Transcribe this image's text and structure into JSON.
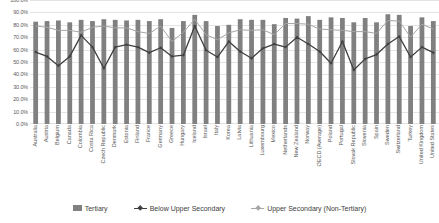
{
  "chart_data": {
    "type": "bar",
    "title": "",
    "subtitle": "",
    "xlabel": "",
    "ylabel": "",
    "ylim": [
      0,
      1.0
    ],
    "grid": true,
    "legend_position": "bottom",
    "y_tick_labels": [
      "100.0%",
      "90.0%",
      "80.0%",
      "70.0%",
      "60.0%",
      "50.0%",
      "40.0%",
      "30.0%",
      "20.0%",
      "10.0%",
      "0.0%"
    ],
    "y_tick_values": [
      1.0,
      0.9,
      0.8,
      0.7,
      0.6,
      0.5,
      0.4,
      0.3,
      0.2,
      0.1,
      0.0
    ],
    "categories": [
      "Australia",
      "Austria",
      "Belgium",
      "Canada",
      "Colombia",
      "Costa Rica",
      "Czech Republic",
      "Denmark",
      "Estonia",
      "Finland",
      "France",
      "Germany",
      "Greece",
      "Hungary",
      "Iceland",
      "Israel",
      "Italy",
      "Korea",
      "Latvia",
      "Lithuania",
      "Luxembourg",
      "Mexico",
      "Netherlands",
      "New Zealand",
      "Norway",
      "OECD (Average)",
      "Poland",
      "Portugal",
      "Slovak Republic",
      "Slovenia",
      "Spain",
      "Sweden",
      "Switzerland",
      "Turkey",
      "United Kingdom",
      "United States"
    ],
    "series": [
      {
        "name": "Tertiary",
        "type": "bar",
        "color": "#808080",
        "values": [
          0.825,
          0.83,
          0.835,
          0.82,
          0.84,
          0.83,
          0.845,
          0.84,
          0.835,
          0.84,
          0.83,
          0.845,
          0.775,
          0.83,
          0.88,
          0.83,
          0.79,
          0.8,
          0.845,
          0.84,
          0.84,
          0.805,
          0.855,
          0.85,
          0.87,
          0.84,
          0.86,
          0.855,
          0.82,
          0.855,
          0.82,
          0.885,
          0.88,
          0.79,
          0.86,
          0.83
        ]
      },
      {
        "name": "Below Upper Secondary",
        "type": "line",
        "color": "#404040",
        "marker": "diamond",
        "values": [
          0.58,
          0.545,
          0.47,
          0.545,
          0.715,
          0.62,
          0.45,
          0.62,
          0.64,
          0.62,
          0.575,
          0.615,
          0.545,
          0.555,
          0.79,
          0.595,
          0.54,
          0.665,
          0.585,
          0.53,
          0.61,
          0.645,
          0.62,
          0.7,
          0.645,
          0.585,
          0.49,
          0.665,
          0.435,
          0.525,
          0.56,
          0.645,
          0.705,
          0.54,
          0.62,
          0.575
        ]
      },
      {
        "name": "Upper Secondary (Non-Tertiary)",
        "type": "line",
        "color": "#a6a6a6",
        "marker": "none",
        "values": [
          0.79,
          0.78,
          0.755,
          0.755,
          0.74,
          0.78,
          0.79,
          0.775,
          0.775,
          0.745,
          0.73,
          0.79,
          0.665,
          0.74,
          0.845,
          0.72,
          0.68,
          0.735,
          0.76,
          0.755,
          0.76,
          0.72,
          0.81,
          0.81,
          0.805,
          0.765,
          0.76,
          0.755,
          0.745,
          0.745,
          0.73,
          0.835,
          0.83,
          0.7,
          0.805,
          0.765
        ]
      }
    ]
  },
  "legend": {
    "items": [
      {
        "label": "Tertiary",
        "marker": "bar-swatch",
        "color": "#808080"
      },
      {
        "label": "Below Upper Secondary",
        "marker": "line-diamond-swatch",
        "color": "#404040"
      },
      {
        "label": "Upper Secondary (Non-Tertiary)",
        "marker": "line-swatch",
        "color": "#a6a6a6"
      }
    ]
  }
}
